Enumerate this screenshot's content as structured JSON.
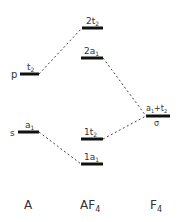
{
  "diagram": {
    "type": "molecular-orbital-diagram",
    "columns": [
      {
        "id": "A",
        "label": "A",
        "sub": ""
      },
      {
        "id": "AF4",
        "label": "AF",
        "sub": "4"
      },
      {
        "id": "F4",
        "label": "F",
        "sub": "4"
      }
    ],
    "atom_levels": [
      {
        "id": "p",
        "side_label": "p",
        "sym": "t",
        "sym_sub": "2",
        "y": 74
      },
      {
        "id": "s",
        "side_label": "s",
        "sym": "a",
        "sym_sub": "1",
        "y": 132
      }
    ],
    "molecule_levels": [
      {
        "id": "2t2",
        "pre": "2",
        "sym": "t",
        "sym_sub": "2",
        "y": 28
      },
      {
        "id": "2a1",
        "pre": "2",
        "sym": "a",
        "sym_sub": "1",
        "y": 58
      },
      {
        "id": "1t2",
        "pre": "1",
        "sym": "t",
        "sym_sub": "2",
        "y": 139
      },
      {
        "id": "1a1",
        "pre": "1",
        "sym": "a",
        "sym_sub": "1",
        "y": 164
      }
    ],
    "ligand_level": {
      "id": "sigma",
      "label_a": "a",
      "label_a_sub": "1",
      "plus": "+",
      "label_t": "t",
      "label_t_sub": "2",
      "sigma": "σ",
      "y": 116
    },
    "connections": [
      {
        "from": "p",
        "to": "2t2"
      },
      {
        "from": "s",
        "to": "1a1"
      },
      {
        "from": "2a1",
        "to": "sigma"
      },
      {
        "from": "1t2",
        "to": "sigma"
      }
    ]
  }
}
